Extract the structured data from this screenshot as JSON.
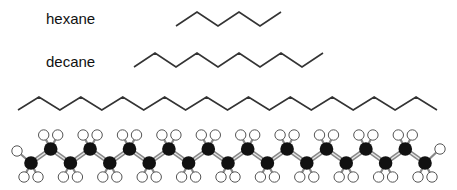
{
  "labels": {
    "hexane": "hexane",
    "decane": "decane"
  },
  "chains": {
    "hexane": {
      "carbons": 6,
      "x0": 176,
      "dx": 21,
      "y_low": 26,
      "y_high": 12,
      "start": "low"
    },
    "decane": {
      "carbons": 10,
      "x0": 134,
      "dx": 21,
      "y_low": 67,
      "y_high": 53,
      "start": "low"
    },
    "long_skeletal": {
      "carbons": 21,
      "x0": 18,
      "dx": 20.95,
      "y_low": 110,
      "y_high": 97,
      "start": "low"
    },
    "ball_and_stick": {
      "carbons": 21,
      "x0": 31,
      "dx": 19.7,
      "y_low": 163,
      "y_high": 149,
      "start": "low"
    }
  },
  "colors": {
    "line": "#333333",
    "carbon": "#111111",
    "hydrogen_fill": "#ffffff",
    "hydrogen_stroke": "#555555",
    "bond": "#888888"
  }
}
